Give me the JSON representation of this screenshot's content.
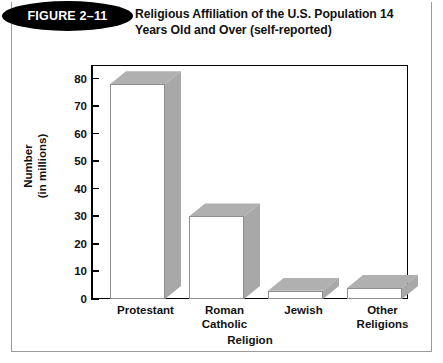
{
  "figure": {
    "badge_label": "FIGURE 2–11",
    "title_line1": "Religious Affiliation of the U.S. Population 14",
    "title_line2": "Years Old and Over (self-reported)"
  },
  "colors": {
    "bar_top_face": "#b0b0b0",
    "bar_side_face": "#a8a8a8",
    "bar_front_face": "#ffffff",
    "axis": "#000000",
    "text": "#111111",
    "badge_background": "#000000",
    "badge_text": "#ffffff",
    "card_border": "#9a9a9a"
  },
  "chart_data": {
    "type": "bar",
    "title": "Religious Affiliation of the U.S. Population 14 Years Old and Over (self-reported)",
    "categories": [
      "Protestant",
      "Roman Catholic",
      "Jewish",
      "Other Religions"
    ],
    "category_lines": [
      [
        "Protestant"
      ],
      [
        "Roman",
        "Catholic"
      ],
      [
        "Jewish"
      ],
      [
        "Other",
        "Religions"
      ]
    ],
    "values": [
      78,
      30,
      3,
      4
    ],
    "xlabel": "Religion",
    "ylabel_line1": "Number",
    "ylabel_line2": "(in millions)",
    "ylabel": "Number (in millions)",
    "ylim": [
      0,
      85
    ],
    "yticks": [
      0,
      10,
      20,
      30,
      40,
      50,
      60,
      70,
      80
    ],
    "ytick_labels": [
      "0",
      "10",
      "20",
      "30",
      "40",
      "50",
      "60",
      "70",
      "80"
    ],
    "grid": false,
    "legend": false,
    "style": "3d-bar"
  }
}
